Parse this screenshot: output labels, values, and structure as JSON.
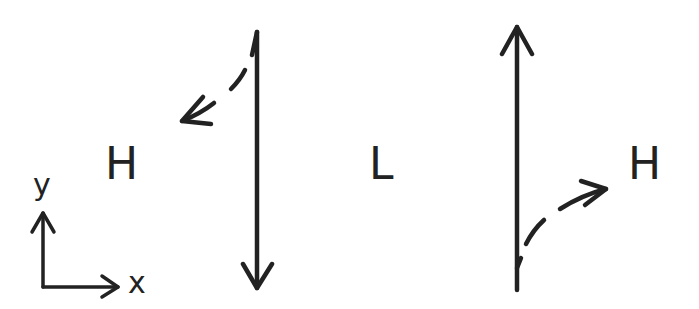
{
  "diagram": {
    "labels": {
      "left_high": "H",
      "center_low": "L",
      "right_high": "H",
      "axis_y": "y",
      "axis_x": "x"
    },
    "elements": [
      {
        "name": "left-vertical-arrow",
        "direction": "down"
      },
      {
        "name": "left-deflection-arrow",
        "style": "dashed",
        "direction": "up-left"
      },
      {
        "name": "right-vertical-arrow",
        "direction": "up"
      },
      {
        "name": "right-deflection-arrow",
        "style": "dashed",
        "direction": "up-right"
      },
      {
        "name": "coordinate-axes",
        "axes": [
          "x",
          "y"
        ]
      }
    ],
    "stroke_color": "#222222",
    "background": "#ffffff"
  }
}
